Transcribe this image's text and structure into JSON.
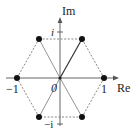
{
  "diagram": {
    "axes": {
      "x_label": "Re",
      "y_label": "Im",
      "origin_label": "0",
      "ticks": {
        "x_pos": "1",
        "x_neg": "−1",
        "y_pos": "i",
        "y_neg": "−i"
      }
    },
    "points": [
      {
        "name": "1",
        "angle_deg": 0
      },
      {
        "name": "ω",
        "angle_deg": 60
      },
      {
        "name": "ω²",
        "angle_deg": 120
      },
      {
        "name": "−1",
        "angle_deg": 180
      },
      {
        "name": "ω⁴",
        "angle_deg": 240
      },
      {
        "name": "ω⁵",
        "angle_deg": 300
      }
    ],
    "colors": {
      "axis": "#555555",
      "point": "#111111",
      "dashed": "#777777",
      "spoke": "#666666",
      "highlight_spoke": "#333333"
    }
  }
}
